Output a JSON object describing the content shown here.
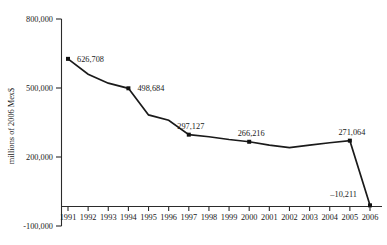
{
  "chart_data": {
    "type": "line",
    "title": "",
    "xlabel": "",
    "ylabel": "millions of 2006 Mex$",
    "ylim": [
      -100000,
      800000
    ],
    "ytick_labels": [
      "800,000",
      "500,000",
      "200,000",
      "-100,000"
    ],
    "ytick_values": [
      800000,
      500000,
      200000,
      -100000
    ],
    "grid": false,
    "legend": "none",
    "categories": [
      "1991",
      "1992",
      "1993",
      "1994",
      "1995",
      "1996",
      "1997",
      "1998",
      "1999",
      "2000",
      "2001",
      "2002",
      "2003",
      "2004",
      "2005",
      "2006"
    ],
    "values": [
      626708,
      560000,
      521000,
      498684,
      383000,
      360000,
      297127,
      288000,
      276000,
      266216,
      252000,
      241000,
      252000,
      262000,
      271064,
      -10211
    ],
    "point_labels": [
      {
        "year": "1991",
        "text": "626,708"
      },
      {
        "year": "1994",
        "text": "498,684"
      },
      {
        "year": "1997",
        "text": "297,127"
      },
      {
        "year": "2000",
        "text": "266,216"
      },
      {
        "year": "2005",
        "text": "271,064"
      },
      {
        "year": "2006",
        "text": "–10,211"
      }
    ],
    "marked_years": [
      "1991",
      "1994",
      "1997",
      "2000",
      "2005",
      "2006"
    ],
    "colors": {
      "line": "#1a1a1a",
      "marker": "#111111",
      "axis": "#2b2b2b",
      "background": "#ffffff"
    }
  }
}
